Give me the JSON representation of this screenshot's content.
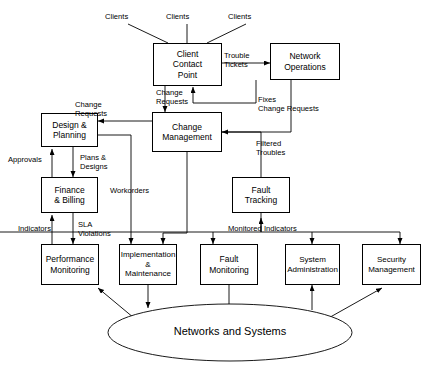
{
  "diagram": {
    "type": "process-flow-diagram",
    "background": "#ffffff",
    "stroke": "#000000",
    "nodes": [
      {
        "id": "client-contact-point",
        "label": "Client\nContact\nPoint",
        "shape": "rect",
        "x": 153,
        "y": 43,
        "w": 69,
        "h": 43
      },
      {
        "id": "network-operations",
        "label": "Network\nOperations",
        "shape": "rect",
        "x": 270,
        "y": 43,
        "w": 70,
        "h": 37
      },
      {
        "id": "change-management",
        "label": "Change\nManagement",
        "shape": "rect",
        "x": 152,
        "y": 112,
        "w": 70,
        "h": 40
      },
      {
        "id": "design-planning",
        "label": "Design &\nPlanning",
        "shape": "rect",
        "x": 41,
        "y": 113,
        "w": 57,
        "h": 34
      },
      {
        "id": "finance-billing",
        "label": "Finance\n& Billing",
        "shape": "rect",
        "x": 41,
        "y": 177,
        "w": 57,
        "h": 36
      },
      {
        "id": "fault-tracking",
        "label": "Fault\nTracking",
        "shape": "rect",
        "x": 232,
        "y": 177,
        "w": 58,
        "h": 36
      },
      {
        "id": "performance-monitoring",
        "label": "Performance\nMonitoring",
        "shape": "rect",
        "x": 41,
        "y": 244,
        "w": 58,
        "h": 41
      },
      {
        "id": "implementation-maintenance",
        "label": "Implementation\n&\nMaintenance",
        "shape": "rect",
        "x": 119,
        "y": 244,
        "w": 58,
        "h": 41
      },
      {
        "id": "fault-monitoring",
        "label": "Fault\nMonitoring",
        "shape": "rect",
        "x": 200,
        "y": 244,
        "w": 58,
        "h": 41
      },
      {
        "id": "system-administration",
        "label": "System\nAdministration",
        "shape": "rect",
        "x": 285,
        "y": 244,
        "w": 55,
        "h": 41
      },
      {
        "id": "security-management",
        "label": "Security\nManagement",
        "shape": "rect",
        "x": 362,
        "y": 244,
        "w": 59,
        "h": 41
      },
      {
        "id": "networks-and-systems",
        "label": "Networks and Systems",
        "shape": "ellipse",
        "x": 108,
        "y": 304,
        "w": 244,
        "h": 57
      }
    ],
    "external_labels": [
      {
        "id": "clients-left",
        "text": "Clients",
        "x": 105,
        "y": 12
      },
      {
        "id": "clients-center",
        "text": "Clients",
        "x": 166,
        "y": 12
      },
      {
        "id": "clients-right",
        "text": "Clients",
        "x": 228,
        "y": 12
      }
    ],
    "edge_labels": [
      {
        "id": "trouble-tickets",
        "text": "Trouble\nTickets",
        "x": 224,
        "y": 51
      },
      {
        "id": "fixes-change-requests",
        "text": "Fixes\nChange Requests",
        "x": 258,
        "y": 95
      },
      {
        "id": "change-requests-top",
        "text": "Change\nRequests",
        "x": 156,
        "y": 88
      },
      {
        "id": "change-requests-left",
        "text": "Change\nRequests",
        "x": 75,
        "y": 100
      },
      {
        "id": "filtered-troubles",
        "text": "Filtered\nTroubles",
        "x": 256,
        "y": 139
      },
      {
        "id": "approvals",
        "text": "Approvals",
        "x": 8,
        "y": 155
      },
      {
        "id": "plans-designs",
        "text": "Plans &\nDesigns",
        "x": 80,
        "y": 153
      },
      {
        "id": "workorders",
        "text": "Workorders",
        "x": 110,
        "y": 186
      },
      {
        "id": "indicators",
        "text": "Indicators",
        "x": 18,
        "y": 224
      },
      {
        "id": "sla-violations",
        "text": "SLA\nViolations",
        "x": 78,
        "y": 220
      },
      {
        "id": "monitored-indicators",
        "text": "Monitored Indicators",
        "x": 228,
        "y": 226
      }
    ]
  }
}
